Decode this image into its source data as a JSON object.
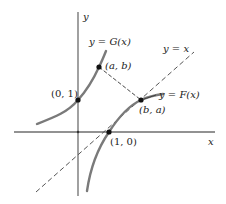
{
  "diagram": {
    "axes": {
      "x_label": "x",
      "y_label": "y"
    },
    "lines": {
      "identity_label": "y = x",
      "identity_style": "dashed"
    },
    "curves": {
      "G": {
        "label": "y = G(x)",
        "color": "#7a7a7a"
      },
      "F": {
        "label": "y = F(x)",
        "color": "#7a7a7a"
      }
    },
    "points": [
      {
        "id": "p01",
        "label": "(0, 1)"
      },
      {
        "id": "p10",
        "label": "(1, 0)"
      },
      {
        "id": "pab",
        "label": "(a, b)"
      },
      {
        "id": "pba",
        "label": "(b, a)"
      }
    ],
    "colors": {
      "axis": "#6e6e6e",
      "curve": "#7a7a7a",
      "dashed": "#555555",
      "point": "#111111",
      "text": "#222222"
    }
  }
}
